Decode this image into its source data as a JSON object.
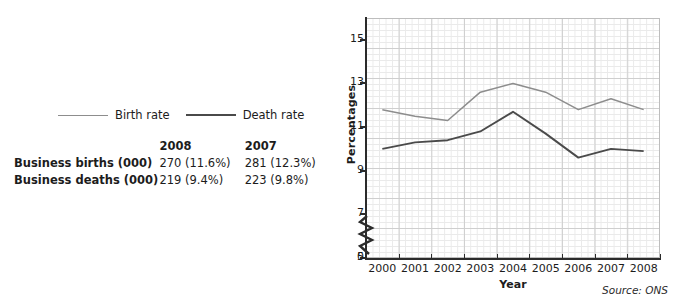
{
  "legend": {
    "items": [
      {
        "label": "Birth rate",
        "color": "#8d8d8d",
        "width": 1.6
      },
      {
        "label": "Death rate",
        "color": "#4a4a4a",
        "width": 2.2
      }
    ]
  },
  "table": {
    "row_header_label": "",
    "columns": [
      "2008",
      "2007"
    ],
    "rows": [
      {
        "label": "Business births (000)",
        "values": [
          "270 (11.6%)",
          "281 (12.3%)"
        ]
      },
      {
        "label": "Business deaths (000)",
        "values": [
          "219 (9.4%)",
          "223 (9.8%)"
        ]
      }
    ]
  },
  "source": "Source: ONS",
  "chart_data": {
    "type": "line",
    "title": "",
    "xlabel": "Year",
    "ylabel": "Percentages",
    "x": [
      "2000",
      "2001",
      "2002",
      "2003",
      "2004",
      "2005",
      "2006",
      "2007",
      "2008"
    ],
    "ylim": [
      5,
      16
    ],
    "y_ticks": [
      5,
      7,
      9,
      11,
      13,
      15
    ],
    "y_axis_break": true,
    "y_axis_break_label": "0",
    "grid": true,
    "legend_position": "above-left",
    "series": [
      {
        "name": "Birth rate",
        "color": "#8d8d8d",
        "values": [
          11.8,
          11.5,
          11.3,
          12.6,
          13.0,
          12.6,
          11.8,
          12.3,
          11.8
        ]
      },
      {
        "name": "Death rate",
        "color": "#4a4a4a",
        "values": [
          10.0,
          10.3,
          10.4,
          10.8,
          11.7,
          10.7,
          9.6,
          10.0,
          9.9
        ]
      }
    ]
  }
}
